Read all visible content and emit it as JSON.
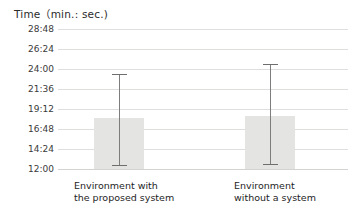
{
  "chart_data": {
    "type": "bar",
    "title": "Time（min.: sec.)",
    "xlabel": "",
    "ylabel": "Time (min.: sec.)",
    "grid": true,
    "legend": null,
    "ylim": [
      "12:00",
      "28:48"
    ],
    "ytick_labels": [
      "28:48",
      "26:24",
      "24:00",
      "21:36",
      "19:12",
      "16:48",
      "14:24",
      "12:00"
    ],
    "ytick_seconds": [
      1728,
      1584,
      1440,
      1296,
      1152,
      1008,
      864,
      720
    ],
    "ytick_interval": "2:24",
    "categories": [
      "Environment with\nthe proposed system",
      "Environment\nwithout a system"
    ],
    "values": [
      "18:05",
      "18:19"
    ],
    "values_seconds": [
      1085,
      1099
    ],
    "error_low": [
      "12:24",
      "12:28"
    ],
    "error_high": [
      "23:26",
      "24:39"
    ],
    "error_low_seconds": [
      744,
      748
    ],
    "error_high_seconds": [
      1406,
      1479
    ],
    "bar_color": "#e4e4e3",
    "error_color": "#7d7d7d",
    "gridline_color": "#dededc"
  }
}
